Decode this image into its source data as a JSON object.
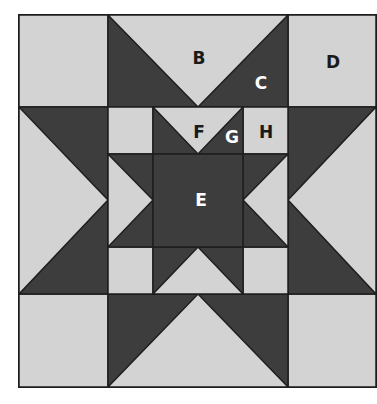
{
  "diagram": {
    "type": "quilt-block",
    "colors": {
      "light": "#d3d3d3",
      "dark": "#3d3d3d",
      "line": "#1e1e1e",
      "label_dark": "#1a1a1a",
      "label_light": "#ffffff",
      "background": "#ffffff"
    },
    "labels": {
      "B": "B",
      "C": "C",
      "D": "D",
      "E": "E",
      "F": "F",
      "G": "G",
      "H": "H"
    }
  }
}
